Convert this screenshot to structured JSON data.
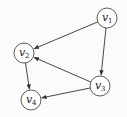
{
  "diagram": {
    "type": "directed-graph",
    "nodes": [
      {
        "id": "v1",
        "label": "v",
        "sub": "1",
        "x": 107,
        "y": 18
      },
      {
        "id": "v2",
        "label": "v",
        "sub": "2",
        "x": 24,
        "y": 53
      },
      {
        "id": "v3",
        "label": "v",
        "sub": "3",
        "x": 100,
        "y": 86
      },
      {
        "id": "v4",
        "label": "v",
        "sub": "4",
        "x": 31,
        "y": 100
      }
    ],
    "edges": [
      {
        "from": "v1",
        "to": "v2"
      },
      {
        "from": "v1",
        "to": "v3"
      },
      {
        "from": "v3",
        "to": "v2"
      },
      {
        "from": "v2",
        "to": "v4"
      },
      {
        "from": "v3",
        "to": "v4"
      }
    ],
    "colors": {
      "stroke": "#333333",
      "fill": "#ffffff",
      "background": "#fbfbfb"
    }
  }
}
